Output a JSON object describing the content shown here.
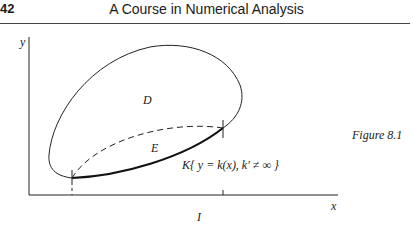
{
  "header": {
    "page_number": "42",
    "running_title": "A Course in Numerical Analysis"
  },
  "figure": {
    "caption": "Figure 8.1",
    "axis_labels": {
      "x": "x",
      "y": "y"
    },
    "region_labels": {
      "outer": "D",
      "inner": "E"
    },
    "curve_label": "K{ y = k(x), k′ ≠ ∞ }",
    "interval_label": "I"
  }
}
